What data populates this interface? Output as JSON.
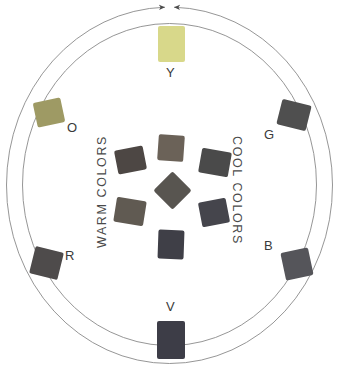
{
  "diagram": {
    "outer_ring": {
      "arc_color": "#8a8a8a",
      "arrow_color": "#4a4a4a",
      "arrow_note": "two arrowheads converge at top center and at bottom center"
    },
    "band_labels": {
      "warm": "WARM COLORS",
      "cool": "COOL COLORS"
    },
    "primary_swatches": [
      {
        "key": "Y",
        "label": "Y",
        "name": "yellow",
        "color": "#d8d88a",
        "x": 158,
        "y": 26,
        "width": 27,
        "height": 36,
        "rotation": 0,
        "label_x": 166,
        "label_y": 66
      },
      {
        "key": "O",
        "label": "O",
        "name": "orange",
        "color": "#9e9a64",
        "x": 35,
        "y": 100,
        "width": 28,
        "height": 25,
        "rotation": -12,
        "label_x": 67,
        "label_y": 121
      },
      {
        "key": "G",
        "label": "G",
        "name": "green",
        "color": "#4f4f4f",
        "x": 279,
        "y": 102,
        "width": 30,
        "height": 26,
        "rotation": 14,
        "label_x": 264,
        "label_y": 128
      },
      {
        "key": "R",
        "label": "R",
        "name": "red",
        "color": "#4e4b4b",
        "x": 32,
        "y": 249,
        "width": 29,
        "height": 28,
        "rotation": 14,
        "label_x": 65,
        "label_y": 249
      },
      {
        "key": "B",
        "label": "B",
        "name": "blue",
        "color": "#55555a",
        "x": 283,
        "y": 250,
        "width": 28,
        "height": 28,
        "rotation": -12,
        "label_x": 264,
        "label_y": 239
      },
      {
        "key": "V",
        "label": "V",
        "name": "violet",
        "color": "#3d3d47",
        "x": 157,
        "y": 321,
        "width": 28,
        "height": 38,
        "rotation": 0,
        "label_x": 166,
        "label_y": 300
      }
    ],
    "inner_swatches": [
      {
        "position": "top",
        "name": "yellow-orange-tertiary",
        "color": "#6b6258",
        "x": 158,
        "y": 135,
        "width": 26,
        "height": 26,
        "rotation": 4
      },
      {
        "position": "upper-left",
        "name": "warm-upper-tertiary",
        "color": "#4d4744",
        "x": 116,
        "y": 148,
        "width": 29,
        "height": 24,
        "rotation": -11
      },
      {
        "position": "upper-right",
        "name": "cool-upper-tertiary",
        "color": "#4a4a4a",
        "x": 200,
        "y": 150,
        "width": 30,
        "height": 25,
        "rotation": 10
      },
      {
        "position": "center",
        "name": "center-neutral",
        "color": "#585550",
        "x": 159,
        "y": 177,
        "width": 27,
        "height": 27,
        "rotation": 45
      },
      {
        "position": "lower-left",
        "name": "warm-lower-tertiary",
        "color": "#605a52",
        "x": 115,
        "y": 199,
        "width": 30,
        "height": 25,
        "rotation": 9
      },
      {
        "position": "lower-right",
        "name": "cool-lower-tertiary",
        "color": "#45454c",
        "x": 200,
        "y": 200,
        "width": 28,
        "height": 25,
        "rotation": -11
      },
      {
        "position": "bottom",
        "name": "violet-tertiary",
        "color": "#3f3f47",
        "x": 158,
        "y": 230,
        "width": 26,
        "height": 29,
        "rotation": 2
      }
    ]
  }
}
